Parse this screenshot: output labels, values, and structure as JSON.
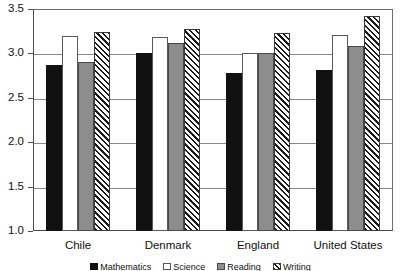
{
  "chart_data": {
    "type": "bar",
    "title": "",
    "subtitle": "",
    "xlabel": "",
    "ylabel": "",
    "categories": [
      "Chile",
      "Denmark",
      "England",
      "United States"
    ],
    "series": [
      {
        "name": "Mathematics",
        "style": "solid-black",
        "values": [
          2.87,
          3.01,
          2.78,
          2.81
        ]
      },
      {
        "name": "Science",
        "style": "white",
        "values": [
          3.2,
          3.18,
          3.01,
          3.21
        ]
      },
      {
        "name": "Reading",
        "style": "gray",
        "values": [
          2.9,
          3.12,
          3.01,
          3.08
        ]
      },
      {
        "name": "Writing",
        "style": "hatched",
        "values": [
          3.24,
          3.27,
          3.23,
          3.42
        ]
      }
    ],
    "ylim": [
      1.0,
      3.5
    ],
    "ytick_labels": [
      "1.0",
      "1.5",
      "2.0",
      "2.5",
      "3.0",
      "3.5"
    ],
    "ytick_values": [
      1.0,
      1.5,
      2.0,
      2.5,
      3.0,
      3.5
    ],
    "grid": true,
    "legend_position": "bottom",
    "legend_clipped": true
  },
  "colors": {
    "series_0": "#111111",
    "series_1": "#ffffff",
    "series_2": "#8d8d8d",
    "series_3": "#1a1a1a",
    "axis": "#4d4d4d",
    "grid": "#888888",
    "background": "#ffffff"
  }
}
